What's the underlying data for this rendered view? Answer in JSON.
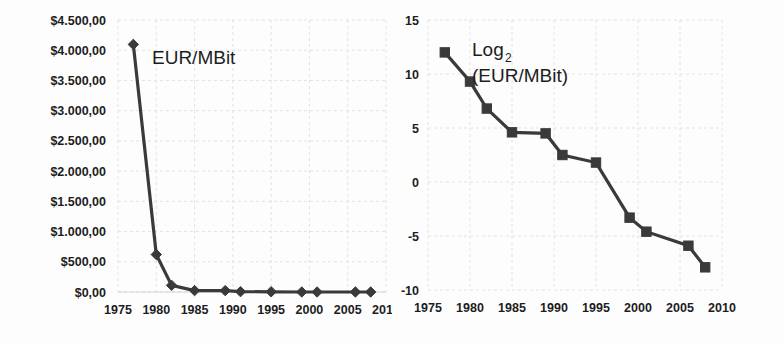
{
  "figure": {
    "background_color": "#fdfdfd",
    "ink_color": "#3a3a3a",
    "grid_color": "#e2e2e2",
    "panels": [
      "left",
      "right"
    ]
  },
  "chart_data": [
    {
      "id": "eur-per-mbit-linear",
      "type": "line",
      "title": "",
      "annotation": "EUR/MBit",
      "annotation_label": "EUR/MBit",
      "xlabel": "",
      "ylabel": "",
      "xlim": [
        1975,
        2010
      ],
      "ylim": [
        0,
        4500
      ],
      "grid": true,
      "legend_position": "none",
      "marker": "diamond",
      "y_tick_values": [
        4500,
        4000,
        3500,
        3000,
        2500,
        2000,
        1500,
        1000,
        500,
        0
      ],
      "y_tick_labels": [
        "$4.500,00",
        "$4.000,00",
        "$3.500,00",
        "$3.000,00",
        "$2.500,00",
        "$2.000,00",
        "$1.500,00",
        "$1.000,00",
        "$500,00",
        "$0,00"
      ],
      "x_tick_values": [
        1975,
        1980,
        1985,
        1990,
        1995,
        2000,
        2005,
        2010
      ],
      "x_tick_labels": [
        "1975",
        "1980",
        "1985",
        "1990",
        "1995",
        "2000",
        "2005",
        "2010"
      ],
      "x_last_label_clipped": true,
      "x": [
        1977,
        1980,
        1982,
        1985,
        1989,
        1991,
        1995,
        1999,
        2001,
        2006,
        2008
      ],
      "values": [
        4096,
        620,
        110,
        24,
        23,
        5.7,
        3.5,
        0.1,
        0.04,
        0.016,
        0.004
      ]
    },
    {
      "id": "eur-per-mbit-log2",
      "type": "line",
      "title": "",
      "annotation": "Log2 (EUR/MBit)",
      "annotation_line1": "Log",
      "annotation_subscript": "2",
      "annotation_line2": "(EUR/MBit)",
      "xlabel": "",
      "ylabel": "",
      "xlim": [
        1975,
        2010
      ],
      "ylim": [
        -10,
        15
      ],
      "grid": true,
      "legend_position": "none",
      "marker": "square",
      "y_tick_values": [
        15,
        10,
        5,
        0,
        -5,
        -10
      ],
      "y_tick_labels": [
        "15",
        "10",
        "5",
        "0",
        "-5",
        "-10"
      ],
      "x_tick_values": [
        1975,
        1980,
        1985,
        1990,
        1995,
        2000,
        2005,
        2010
      ],
      "x_tick_labels": [
        "1975",
        "1980",
        "1985",
        "1990",
        "1995",
        "2000",
        "2005",
        "2010"
      ],
      "x_last_label_clipped": false,
      "x": [
        1977,
        1980,
        1982,
        1985,
        1989,
        1991,
        1995,
        1999,
        2001,
        2006,
        2008
      ],
      "values": [
        12.0,
        9.3,
        6.8,
        4.6,
        4.5,
        2.5,
        1.8,
        -3.3,
        -4.6,
        -5.9,
        -7.9
      ]
    }
  ]
}
